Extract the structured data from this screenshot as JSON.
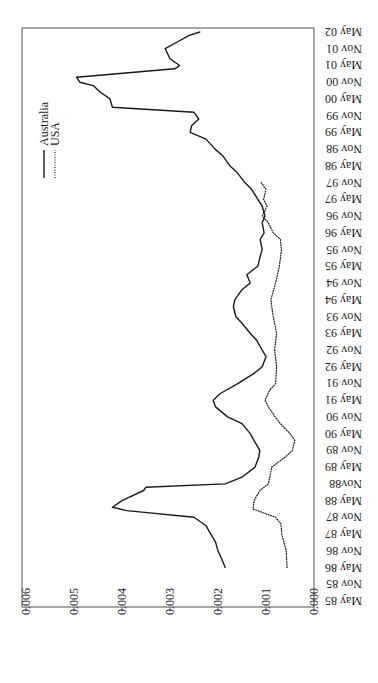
{
  "chart_data": {
    "type": "line",
    "orientation_note": "figure is rendered rotated 90 degrees (dates along right edge, values along bottom)",
    "title": "",
    "xlabel": "",
    "ylabel": "",
    "ylim": [
      0.0,
      0.006
    ],
    "y_ticks": [
      "0.000",
      "0.001",
      "0.002",
      "0.003",
      "0.004",
      "0.005",
      "0.006"
    ],
    "y_tick_values": [
      0.0,
      0.001,
      0.002,
      0.003,
      0.004,
      0.005,
      0.006
    ],
    "categories": [
      "May 85",
      "Nov 85",
      "May 86",
      "Nov 86",
      "May 87",
      "Nov 87",
      "May 88",
      "Nov88",
      "May 89",
      "Nov 89",
      "May 90",
      "Nov 90",
      "May 91",
      "Nov 91",
      "May 92",
      "Nov 92",
      "May 93",
      "Nov 93",
      "May 94",
      "Nov 94",
      "May 95",
      "Nov 95",
      "May 96",
      "Nov 96",
      "May 97",
      "Nov 97",
      "May 98",
      "Nov 98",
      "May 99",
      "Nov 99",
      "May 00",
      "Nov 00",
      "May 01",
      "Nov 01",
      "May 02"
    ],
    "grid": false,
    "legend": {
      "position": "upper-left (rotated)",
      "entries": [
        {
          "label": "Australia",
          "style": "solid"
        },
        {
          "label": "USA",
          "style": "dotted"
        }
      ]
    },
    "series": [
      {
        "name": "Australia",
        "style": "solid",
        "color": "#1a1a1a",
        "points": [
          {
            "t": 2.0,
            "v": 0.00185
          },
          {
            "t": 2.5,
            "v": 0.00192
          },
          {
            "t": 3.0,
            "v": 0.002
          },
          {
            "t": 3.5,
            "v": 0.00205
          },
          {
            "t": 4.0,
            "v": 0.00215
          },
          {
            "t": 4.5,
            "v": 0.00225
          },
          {
            "t": 5.0,
            "v": 0.0025
          },
          {
            "t": 5.4,
            "v": 0.0039
          },
          {
            "t": 5.6,
            "v": 0.0042
          },
          {
            "t": 6.0,
            "v": 0.004
          },
          {
            "t": 6.6,
            "v": 0.00355
          },
          {
            "t": 6.8,
            "v": 0.0035
          },
          {
            "t": 7.0,
            "v": 0.00185
          },
          {
            "t": 7.4,
            "v": 0.0015
          },
          {
            "t": 8.0,
            "v": 0.00123
          },
          {
            "t": 8.6,
            "v": 0.00115
          },
          {
            "t": 9.0,
            "v": 0.00113
          },
          {
            "t": 9.6,
            "v": 0.00125
          },
          {
            "t": 10.0,
            "v": 0.00133
          },
          {
            "t": 10.6,
            "v": 0.0015
          },
          {
            "t": 11.0,
            "v": 0.0018
          },
          {
            "t": 11.6,
            "v": 0.00205
          },
          {
            "t": 12.0,
            "v": 0.0021
          },
          {
            "t": 12.4,
            "v": 0.00195
          },
          {
            "t": 13.0,
            "v": 0.00158
          },
          {
            "t": 13.6,
            "v": 0.00125
          },
          {
            "t": 14.0,
            "v": 0.00108
          },
          {
            "t": 14.6,
            "v": 0.001
          },
          {
            "t": 15.0,
            "v": 0.00108
          },
          {
            "t": 15.6,
            "v": 0.0012
          },
          {
            "t": 16.0,
            "v": 0.00133
          },
          {
            "t": 16.6,
            "v": 0.0015
          },
          {
            "t": 17.0,
            "v": 0.00163
          },
          {
            "t": 17.6,
            "v": 0.00168
          },
          {
            "t": 18.0,
            "v": 0.00165
          },
          {
            "t": 18.6,
            "v": 0.0015
          },
          {
            "t": 19.0,
            "v": 0.00133
          },
          {
            "t": 19.5,
            "v": 0.0014
          },
          {
            "t": 20.0,
            "v": 0.00117
          },
          {
            "t": 20.6,
            "v": 0.00112
          },
          {
            "t": 21.0,
            "v": 0.00108
          },
          {
            "t": 21.6,
            "v": 0.00112
          },
          {
            "t": 22.0,
            "v": 0.00104
          },
          {
            "t": 22.6,
            "v": 0.00108
          },
          {
            "t": 23.0,
            "v": 0.00102
          },
          {
            "t": 23.6,
            "v": 0.00108
          },
          {
            "t": 24.0,
            "v": 0.00117
          },
          {
            "t": 24.6,
            "v": 0.0013
          },
          {
            "t": 25.0,
            "v": 0.00144
          },
          {
            "t": 25.6,
            "v": 0.0016
          },
          {
            "t": 26.0,
            "v": 0.00175
          },
          {
            "t": 26.6,
            "v": 0.0019
          },
          {
            "t": 27.0,
            "v": 0.00206
          },
          {
            "t": 27.6,
            "v": 0.00225
          },
          {
            "t": 28.0,
            "v": 0.00258
          },
          {
            "t": 28.4,
            "v": 0.00255
          },
          {
            "t": 28.8,
            "v": 0.0024
          },
          {
            "t": 29.2,
            "v": 0.0025
          },
          {
            "t": 29.5,
            "v": 0.0042
          },
          {
            "t": 30.0,
            "v": 0.00425
          },
          {
            "t": 30.4,
            "v": 0.00445
          },
          {
            "t": 30.8,
            "v": 0.0046
          },
          {
            "t": 31.0,
            "v": 0.00488
          },
          {
            "t": 31.3,
            "v": 0.00495
          },
          {
            "t": 31.8,
            "v": 0.0029
          },
          {
            "t": 32.0,
            "v": 0.0028
          },
          {
            "t": 32.4,
            "v": 0.003
          },
          {
            "t": 33.0,
            "v": 0.0031
          },
          {
            "t": 33.4,
            "v": 0.00285
          },
          {
            "t": 33.8,
            "v": 0.0026
          },
          {
            "t": 34.0,
            "v": 0.00238
          }
        ]
      },
      {
        "name": "USA",
        "style": "dotted",
        "color": "#1a1a1a",
        "points": [
          {
            "t": 2.0,
            "v": 0.00056
          },
          {
            "t": 3.0,
            "v": 0.00058
          },
          {
            "t": 4.0,
            "v": 0.00067
          },
          {
            "t": 4.6,
            "v": 0.00069
          },
          {
            "t": 5.0,
            "v": 0.0008
          },
          {
            "t": 5.5,
            "v": 0.00127
          },
          {
            "t": 6.0,
            "v": 0.00125
          },
          {
            "t": 6.6,
            "v": 0.00113
          },
          {
            "t": 7.0,
            "v": 0.00095
          },
          {
            "t": 8.0,
            "v": 0.00088
          },
          {
            "t": 8.6,
            "v": 0.0006
          },
          {
            "t": 9.0,
            "v": 0.00045
          },
          {
            "t": 9.6,
            "v": 0.0004
          },
          {
            "t": 10.0,
            "v": 0.0005
          },
          {
            "t": 10.6,
            "v": 0.0007
          },
          {
            "t": 11.0,
            "v": 0.00081
          },
          {
            "t": 11.6,
            "v": 0.00095
          },
          {
            "t": 12.0,
            "v": 0.00102
          },
          {
            "t": 12.6,
            "v": 0.00092
          },
          {
            "t": 13.0,
            "v": 0.0008
          },
          {
            "t": 14.0,
            "v": 0.00078
          },
          {
            "t": 15.0,
            "v": 0.00082
          },
          {
            "t": 16.0,
            "v": 0.00078
          },
          {
            "t": 17.0,
            "v": 0.00085
          },
          {
            "t": 18.0,
            "v": 0.0009
          },
          {
            "t": 19.0,
            "v": 0.0008
          },
          {
            "t": 20.0,
            "v": 0.00072
          },
          {
            "t": 21.0,
            "v": 0.00068
          },
          {
            "t": 21.6,
            "v": 0.0007
          },
          {
            "t": 22.0,
            "v": 0.00085
          },
          {
            "t": 22.6,
            "v": 0.00095
          },
          {
            "t": 23.0,
            "v": 0.00108
          },
          {
            "t": 23.6,
            "v": 0.00098
          },
          {
            "t": 24.0,
            "v": 0.00105
          },
          {
            "t": 24.6,
            "v": 0.001
          },
          {
            "t": 25.0,
            "v": 0.0011
          }
        ]
      }
    ],
    "layout": {
      "plot_left": 22,
      "plot_right": 314,
      "plot_top": 28,
      "plot_bottom": 607,
      "date_first_y": 601,
      "date_last_y": 32,
      "value_zero_x": 314,
      "px_per_0001": 48
    }
  }
}
